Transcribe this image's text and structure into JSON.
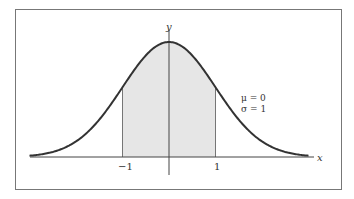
{
  "chart_data": {
    "type": "area",
    "title": "",
    "xlabel": "x",
    "ylabel": "y",
    "distribution": "normal",
    "params": {
      "mu": 0,
      "sigma": 1
    },
    "annotation": [
      "μ = 0",
      "σ = 1"
    ],
    "x_ticks": [
      -1,
      1
    ],
    "x_tick_labels": [
      "−1",
      "1"
    ],
    "x_range": [
      -3,
      3
    ],
    "shaded_region": {
      "from": -1,
      "to": 1
    },
    "series": [
      {
        "name": "standard normal pdf",
        "x": [
          -3,
          -2.5,
          -2,
          -1.5,
          -1,
          -0.5,
          0,
          0.5,
          1,
          1.5,
          2,
          2.5,
          3
        ],
        "values": [
          0.0044,
          0.0175,
          0.054,
          0.1295,
          0.242,
          0.3521,
          0.3989,
          0.3521,
          0.242,
          0.1295,
          0.054,
          0.0175,
          0.0044
        ]
      }
    ],
    "grid": false,
    "legend": "none"
  },
  "labels": {
    "x_axis": "x",
    "y_axis": "y",
    "tick_neg1": "−1",
    "tick_pos1": "1",
    "mu_line": "μ = 0",
    "sigma_line": "σ = 1"
  },
  "colors": {
    "curve": "#333333",
    "shade": "#e6e6e6",
    "axis": "#444444",
    "frame": "#777777"
  }
}
